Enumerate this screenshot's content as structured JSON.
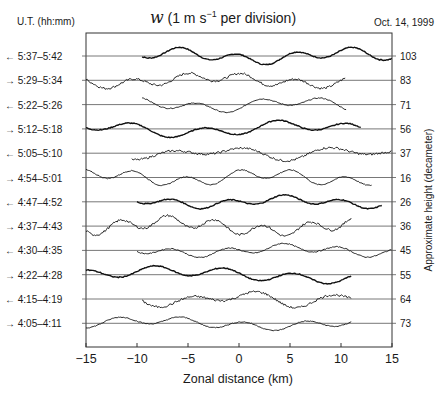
{
  "chart_data": {
    "type": "line",
    "title_parts": {
      "var": "w",
      "text_before_sup": " (1 m s",
      "sup": "−1",
      "text_after_sup": " per division)"
    },
    "date": "Oct. 14, 1999",
    "left_axis_title": "U.T. (hh:mm)",
    "xlabel": "Zonal distance (km)",
    "ylabel_right": "Approximate height (decameter)",
    "xlim": [
      -15,
      15
    ],
    "x_ticks": [
      -15,
      -10,
      -5,
      0,
      5,
      10,
      15
    ],
    "x_tick_labels": [
      "−15",
      "−10",
      "−5",
      "0",
      "5",
      "10",
      "15"
    ],
    "grid": "horizontal baseline per trace",
    "series": [
      {
        "time": "5:37–5:42",
        "direction": "←",
        "height_dam": "103",
        "x_range": [
          -9.5,
          15
        ]
      },
      {
        "time": "5:29–5:34",
        "direction": "→",
        "height_dam": "83",
        "x_range": [
          -15,
          10.5
        ]
      },
      {
        "time": "5:22–5:26",
        "direction": "←",
        "height_dam": "71",
        "x_range": [
          -9.5,
          10.5
        ]
      },
      {
        "time": "5:12–5:18",
        "direction": "→",
        "height_dam": "56",
        "x_range": [
          -15,
          12
        ]
      },
      {
        "time": "5:05–5:10",
        "direction": "←",
        "height_dam": "37",
        "x_range": [
          -10.5,
          15
        ]
      },
      {
        "time": "4:54–5:01",
        "direction": "→",
        "height_dam": "16",
        "x_range": [
          -15,
          13
        ]
      },
      {
        "time": "4:47–4:52",
        "direction": "←",
        "height_dam": "26",
        "x_range": [
          -10,
          14
        ]
      },
      {
        "time": "4:37–4:43",
        "direction": "→",
        "height_dam": "36",
        "x_range": [
          -15,
          11
        ]
      },
      {
        "time": "4:30–4:35",
        "direction": "←",
        "height_dam": "45",
        "x_range": [
          -10,
          15
        ]
      },
      {
        "time": "4:22–4:28",
        "direction": "→",
        "height_dam": "55",
        "x_range": [
          -15,
          11
        ]
      },
      {
        "time": "4:15–4:19",
        "direction": "←",
        "height_dam": "64",
        "x_range": [
          -9.5,
          11
        ]
      },
      {
        "time": "4:05–4:11",
        "direction": "→",
        "height_dam": "73",
        "x_range": [
          -15,
          11
        ]
      }
    ]
  }
}
